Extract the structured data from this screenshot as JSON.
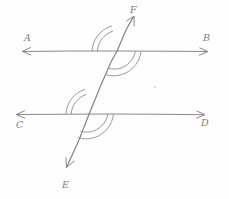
{
  "figure": {
    "stroke_color": "#8a8a8a",
    "arc_color": "#9a9a9a",
    "background_color": "#fefefe"
  },
  "labels": {
    "a": "A",
    "b": "B",
    "c": "C",
    "d": "D",
    "e": "E",
    "f": "F"
  },
  "lines": [
    {
      "name": "line-ab",
      "from_label": "A",
      "to_label": "B",
      "y": 51,
      "x_start": 22,
      "x_end": 208,
      "arrow_start": true,
      "arrow_end": true
    },
    {
      "name": "line-cd",
      "from_label": "C",
      "to_label": "D",
      "y": 114,
      "x_start": 16,
      "x_end": 205,
      "arrow_start": true,
      "arrow_end": true
    },
    {
      "name": "line-ef",
      "from_label": "E",
      "to_label": "F",
      "x_start": 66,
      "y_start": 168,
      "x_end": 134,
      "y_end": 16,
      "arrow_start": true,
      "arrow_end": true
    }
  ],
  "intersections": [
    {
      "name": "upper-intersection",
      "x": 117,
      "y": 51,
      "angle_marks": [
        {
          "position": "upper-left",
          "arcs": 2
        },
        {
          "position": "lower-right",
          "arcs": 2
        }
      ]
    },
    {
      "name": "lower-intersection",
      "x": 89,
      "y": 114,
      "angle_marks": [
        {
          "position": "upper-left",
          "arcs": 2
        },
        {
          "position": "lower-right",
          "arcs": 2
        }
      ]
    }
  ],
  "label_positions": {
    "a": {
      "x": 24,
      "y": 41
    },
    "b": {
      "x": 203,
      "y": 41
    },
    "c": {
      "x": 16,
      "y": 128
    },
    "d": {
      "x": 201,
      "y": 126
    },
    "e": {
      "x": 62,
      "y": 188
    },
    "f": {
      "x": 130,
      "y": 13
    }
  }
}
